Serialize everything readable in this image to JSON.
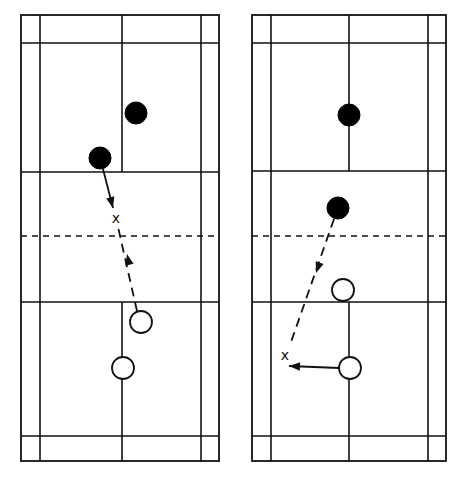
{
  "figure": {
    "colors": {
      "line": "#111111",
      "filled_player": "#000000",
      "open_player": "#ffffff",
      "background": "#ffffff"
    }
  },
  "courts": [
    {
      "id": "left",
      "bounds": {
        "x1": 21,
        "x2": 219,
        "y1": 15,
        "y2": 461
      },
      "inner_sidelines": [
        40,
        201
      ],
      "center_x": 122,
      "back_service_lines": [
        43,
        436
      ],
      "short_service_lines": [
        172,
        302
      ],
      "net_y": 236,
      "players_filled": [
        {
          "cx": 136,
          "cy": 113,
          "r": 11
        },
        {
          "cx": 100,
          "cy": 158,
          "r": 11
        }
      ],
      "players_open": [
        {
          "cx": 141,
          "cy": 322,
          "r": 11
        },
        {
          "cx": 123,
          "cy": 368,
          "r": 11
        }
      ],
      "x_marks": [
        {
          "x": 116,
          "y": 218,
          "label": "x"
        }
      ],
      "paths": [
        {
          "style": "solid",
          "from": [
            103,
            169
          ],
          "to": [
            113,
            208
          ],
          "arrow": "end"
        },
        {
          "style": "dashed",
          "from": [
            137,
            311
          ],
          "to": [
            118,
            227
          ],
          "arrow_at": [
            127,
            254
          ],
          "arrow_dir": "up"
        }
      ]
    },
    {
      "id": "right",
      "bounds": {
        "x1": 252,
        "x2": 446,
        "y1": 15,
        "y2": 461
      },
      "inner_sidelines": [
        271,
        428
      ],
      "center_x": 349,
      "back_service_lines": [
        43,
        436
      ],
      "short_service_lines": [
        171,
        302
      ],
      "net_y": 236,
      "players_filled": [
        {
          "cx": 349,
          "cy": 115,
          "r": 11
        },
        {
          "cx": 338,
          "cy": 208,
          "r": 11
        }
      ],
      "players_open": [
        {
          "cx": 343,
          "cy": 290,
          "r": 11
        },
        {
          "cx": 350,
          "cy": 368,
          "r": 11
        }
      ],
      "x_marks": [
        {
          "x": 285,
          "y": 355,
          "label": "x"
        }
      ],
      "paths": [
        {
          "style": "dashed",
          "from": [
            334,
            219
          ],
          "to": [
            290,
            345
          ],
          "arrow_at": [
            316,
            273
          ],
          "arrow_dir": "down"
        },
        {
          "style": "solid",
          "from": [
            339,
            368
          ],
          "to": [
            289,
            366
          ],
          "arrow": "end"
        }
      ]
    }
  ]
}
